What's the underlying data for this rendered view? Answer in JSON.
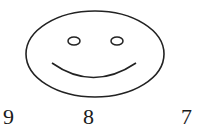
{
  "figure": {
    "stroke_color": "#222222",
    "labels": [
      "9",
      "8",
      "7"
    ]
  }
}
